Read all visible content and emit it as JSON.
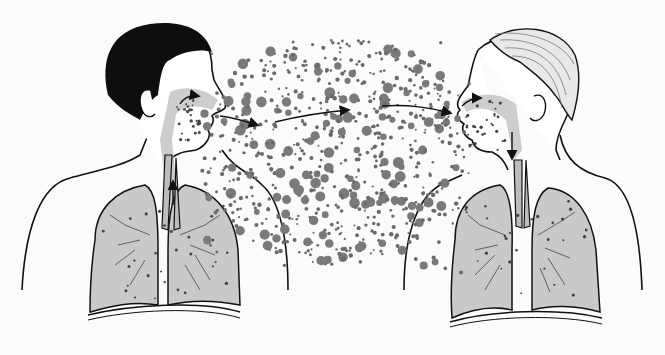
{
  "diagram": {
    "kind": "medical-illustration",
    "colors": {
      "background": "#fbfbfb",
      "outline": "#111111",
      "hair_dark": "#0e0e0e",
      "hair_light": "#9a9a9a",
      "lung_fill": "#c9c9c9",
      "droplet": "#6a6a6a",
      "skin": "#ffffff"
    },
    "figures": [
      {
        "id": "source-person",
        "position": "left",
        "facing": "right",
        "hair": "dark",
        "role": "exhaling droplets"
      },
      {
        "id": "recipient-person",
        "position": "right",
        "facing": "left",
        "hair": "light",
        "role": "inhaling droplets"
      }
    ],
    "arrows": [
      {
        "id": "nasal-arrow-left",
        "from": [
          185,
          102
        ],
        "to": [
          198,
          96
        ]
      },
      {
        "id": "exhale-arrow",
        "from": [
          225,
          118
        ],
        "to": [
          257,
          125
        ]
      },
      {
        "id": "cloud-arrow-1",
        "from": [
          275,
          122
        ],
        "to": [
          348,
          110
        ]
      },
      {
        "id": "cloud-arrow-2",
        "from": [
          382,
          107
        ],
        "to": [
          450,
          113
        ]
      },
      {
        "id": "inhale-arrow-right",
        "from": [
          462,
          105
        ],
        "to": [
          480,
          98
        ]
      },
      {
        "id": "trachea-arrow-left",
        "from": [
          173,
          202
        ],
        "to": [
          173,
          182
        ]
      },
      {
        "id": "trachea-arrow-right",
        "from": [
          512,
          132
        ],
        "to": [
          512,
          158
        ]
      }
    ],
    "droplet_cloud": {
      "center": [
        330,
        150
      ],
      "extent": [
        200,
        40,
        470,
        275
      ]
    }
  }
}
